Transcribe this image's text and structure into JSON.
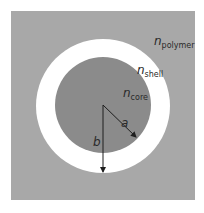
{
  "diagram": {
    "type": "core-shell cross-section",
    "colors": {
      "background": "#ffffff",
      "polymer": "#a8a8a8",
      "shell": "#ffffff",
      "core": "#8b8b8b",
      "arrow": "#1e1e1e",
      "text": "#2a2a2a"
    },
    "regions": [
      {
        "id": "polymer",
        "label_base": "n",
        "label_sub": "polymer"
      },
      {
        "id": "shell",
        "label_base": "n",
        "label_sub": "shell"
      },
      {
        "id": "core",
        "label_base": "n",
        "label_sub": "core"
      }
    ],
    "radii": [
      {
        "id": "a",
        "label": "a",
        "description": "core radius"
      },
      {
        "id": "b",
        "label": "b",
        "description": "shell outer radius"
      }
    ]
  }
}
